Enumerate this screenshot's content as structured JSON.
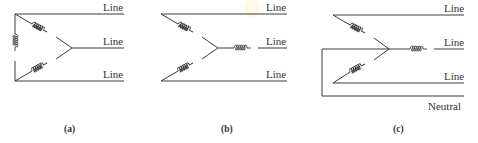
{
  "figure": {
    "panels": [
      {
        "id": "a",
        "caption": "(a)",
        "configuration": "delta",
        "labels": [
          "Line",
          "Line",
          "Line"
        ]
      },
      {
        "id": "b",
        "caption": "(b)",
        "configuration": "wye (3-wire)",
        "labels": [
          "Line",
          "Line",
          "Line"
        ]
      },
      {
        "id": "c",
        "caption": "(c)",
        "configuration": "wye with neutral (4-wire)",
        "labels": [
          "Line",
          "Line",
          "Line",
          "Neutral"
        ]
      }
    ]
  }
}
